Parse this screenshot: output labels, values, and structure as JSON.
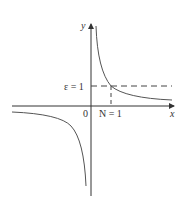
{
  "figure": {
    "function": "y = 1/x",
    "axes": {
      "x_label": "x",
      "y_label": "y",
      "origin_label": "0"
    },
    "annotations": {
      "epsilon_label": "ε = 1",
      "n_label": "N = 1"
    },
    "colors": {
      "curve": "#555555",
      "axis": "#333333",
      "dashed": "#444444",
      "background": "#ffffff"
    }
  }
}
